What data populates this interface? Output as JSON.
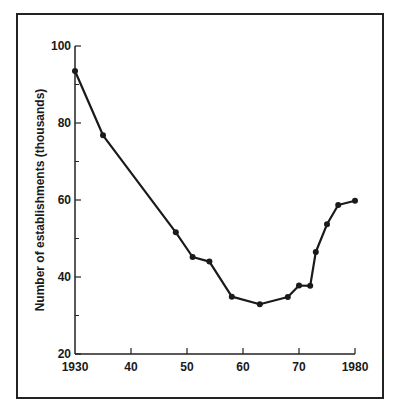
{
  "chart_data": {
    "type": "line",
    "title": "",
    "xlabel": "",
    "ylabel": "Number of establishments (thousands)",
    "xlim": [
      1930,
      1980
    ],
    "ylim": [
      20,
      100
    ],
    "x_ticks": [
      1930,
      1940,
      1950,
      1960,
      1970,
      1980
    ],
    "x_tick_labels": [
      "1930",
      "40",
      "50",
      "60",
      "70",
      "1980"
    ],
    "y_ticks": [
      20,
      40,
      60,
      80,
      100
    ],
    "y_tick_labels": [
      "20",
      "40",
      "60",
      "80",
      "100"
    ],
    "y_minor_ticks": [
      30,
      50,
      70,
      90
    ],
    "grid": false,
    "legend": null,
    "series": [
      {
        "name": "Establishments",
        "x": [
          1930,
          1935,
          1948,
          1951,
          1954,
          1958,
          1963,
          1968,
          1970,
          1972,
          1973,
          1975,
          1977,
          1980
        ],
        "values": [
          93.5,
          76.8,
          51.6,
          45.2,
          44.0,
          34.9,
          32.9,
          34.8,
          37.8,
          37.7,
          46.5,
          53.7,
          58.7,
          59.8
        ]
      }
    ]
  }
}
